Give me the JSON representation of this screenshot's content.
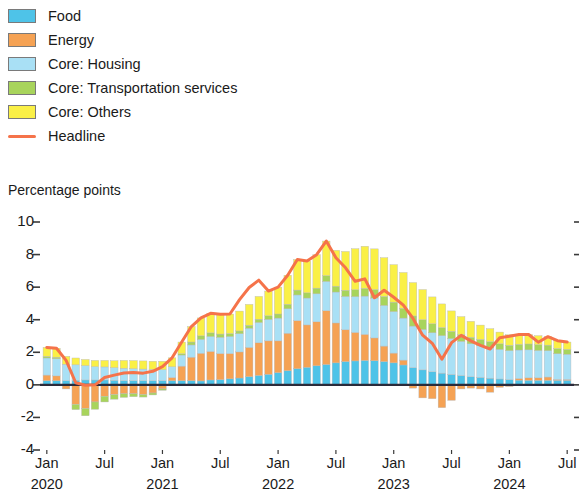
{
  "legend": {
    "items": [
      {
        "label": "Food",
        "color": "#4EC3E8",
        "marker": "swatch"
      },
      {
        "label": "Energy",
        "color": "#F5A254",
        "marker": "swatch"
      },
      {
        "label": "Core: Housing",
        "color": "#A9E0F5",
        "marker": "swatch"
      },
      {
        "label": "Core: Transportation services",
        "color": "#A8D45C",
        "marker": "swatch"
      },
      {
        "label": "Core: Others",
        "color": "#FAF046",
        "marker": "swatch"
      },
      {
        "label": "Headline",
        "color": "#F5734A",
        "marker": "line"
      }
    ]
  },
  "axis_title": "Percentage points",
  "chart_data": {
    "type": "bar",
    "stacked": true,
    "title": "",
    "subtitle": "",
    "xlabel": "",
    "ylabel": "Percentage points",
    "ylim": [
      -4,
      10
    ],
    "yticks": [
      10,
      8,
      6,
      4,
      2,
      0,
      -2,
      -4
    ],
    "ytick_labels": [
      "10",
      "8",
      "6",
      "4",
      "2",
      "0",
      "-2",
      "-4"
    ],
    "grid": false,
    "legend_position": "top-left",
    "x_tick_labels": [
      {
        "label": "Jan",
        "year": "2020",
        "index": 0
      },
      {
        "label": "Jul",
        "year": "",
        "index": 6
      },
      {
        "label": "Jan",
        "year": "2021",
        "index": 12
      },
      {
        "label": "Jul",
        "year": "",
        "index": 18
      },
      {
        "label": "Jan",
        "year": "2022",
        "index": 24
      },
      {
        "label": "Jul",
        "year": "",
        "index": 30
      },
      {
        "label": "Jan",
        "year": "2023",
        "index": 36
      },
      {
        "label": "Jul",
        "year": "",
        "index": 42
      },
      {
        "label": "Jan",
        "year": "2024",
        "index": 48
      },
      {
        "label": "Jul",
        "year": "",
        "index": 54
      }
    ],
    "categories": [
      "Jan 2020",
      "Feb 2020",
      "Mar 2020",
      "Apr 2020",
      "May 2020",
      "Jun 2020",
      "Jul 2020",
      "Aug 2020",
      "Sep 2020",
      "Oct 2020",
      "Nov 2020",
      "Dec 2020",
      "Jan 2021",
      "Feb 2021",
      "Mar 2021",
      "Apr 2021",
      "May 2021",
      "Jun 2021",
      "Jul 2021",
      "Aug 2021",
      "Sep 2021",
      "Oct 2021",
      "Nov 2021",
      "Dec 2021",
      "Jan 2022",
      "Feb 2022",
      "Mar 2022",
      "Apr 2022",
      "May 2022",
      "Jun 2022",
      "Jul 2022",
      "Aug 2022",
      "Sep 2022",
      "Oct 2022",
      "Nov 2022",
      "Dec 2022",
      "Jan 2023",
      "Feb 2023",
      "Mar 2023",
      "Apr 2023",
      "May 2023",
      "Jun 2023",
      "Jul 2023",
      "Aug 2023",
      "Sep 2023",
      "Oct 2023",
      "Nov 2023",
      "Dec 2023",
      "Jan 2024",
      "Feb 2024",
      "Mar 2024",
      "Apr 2024",
      "May 2024",
      "Jun 2024",
      "Jul 2024"
    ],
    "series": [
      {
        "name": "Food",
        "color": "#4EC3E8",
        "values": [
          0.25,
          0.25,
          0.25,
          0.28,
          0.3,
          0.3,
          0.3,
          0.28,
          0.26,
          0.25,
          0.25,
          0.25,
          0.25,
          0.25,
          0.25,
          0.25,
          0.24,
          0.3,
          0.32,
          0.37,
          0.42,
          0.5,
          0.58,
          0.65,
          0.75,
          0.87,
          0.99,
          1.08,
          1.17,
          1.25,
          1.35,
          1.43,
          1.47,
          1.5,
          1.48,
          1.43,
          1.35,
          1.22,
          1.06,
          0.92,
          0.8,
          0.72,
          0.64,
          0.57,
          0.5,
          0.46,
          0.41,
          0.36,
          0.32,
          0.29,
          0.28,
          0.28,
          0.28,
          0.28,
          0.28
        ]
      },
      {
        "name": "Energy",
        "color": "#F5A254",
        "values": [
          0.35,
          0.3,
          -0.25,
          -1.2,
          -1.45,
          -1.05,
          -0.7,
          -0.6,
          -0.55,
          -0.55,
          -0.6,
          -0.5,
          -0.25,
          0.2,
          0.9,
          1.45,
          1.7,
          1.75,
          1.6,
          1.55,
          1.6,
          1.8,
          2.0,
          2.05,
          1.95,
          2.3,
          2.95,
          2.6,
          2.7,
          3.3,
          2.45,
          1.95,
          1.75,
          1.6,
          1.4,
          0.95,
          0.6,
          0.3,
          -0.2,
          -0.8,
          -0.85,
          -1.4,
          -0.95,
          -0.25,
          -0.2,
          -0.25,
          -0.45,
          -0.15,
          -0.1,
          0.1,
          0.15,
          0.15,
          0.2,
          0.05,
          0.05
        ]
      },
      {
        "name": "Core: Housing",
        "color": "#A9E0F5",
        "values": [
          1.05,
          1.05,
          1.02,
          0.95,
          0.88,
          0.82,
          0.8,
          0.78,
          0.76,
          0.74,
          0.72,
          0.7,
          0.68,
          0.66,
          0.68,
          0.75,
          0.85,
          0.92,
          1.0,
          1.05,
          1.12,
          1.18,
          1.25,
          1.32,
          1.4,
          1.5,
          1.58,
          1.65,
          1.72,
          1.8,
          1.9,
          2.05,
          2.2,
          2.35,
          2.45,
          2.5,
          2.55,
          2.58,
          2.55,
          2.48,
          2.4,
          2.3,
          2.2,
          2.1,
          2.02,
          1.95,
          1.88,
          1.82,
          1.78,
          1.75,
          1.72,
          1.68,
          1.62,
          1.58,
          1.55
        ]
      },
      {
        "name": "Core: Transportation services",
        "color": "#A8D45C",
        "values": [
          0.1,
          0.1,
          0.0,
          -0.32,
          -0.45,
          -0.45,
          -0.35,
          -0.28,
          -0.22,
          -0.18,
          -0.15,
          -0.12,
          -0.08,
          0.0,
          0.08,
          0.18,
          0.22,
          0.22,
          0.2,
          0.18,
          0.17,
          0.18,
          0.2,
          0.22,
          0.25,
          0.28,
          0.3,
          0.32,
          0.35,
          0.36,
          0.36,
          0.38,
          0.42,
          0.48,
          0.52,
          0.55,
          0.58,
          0.6,
          0.62,
          0.6,
          0.55,
          0.5,
          0.45,
          0.42,
          0.4,
          0.38,
          0.36,
          0.34,
          0.33,
          0.35,
          0.36,
          0.36,
          0.34,
          0.32,
          0.3
        ]
      },
      {
        "name": "Core: Others",
        "color": "#FAF046",
        "values": [
          0.55,
          0.55,
          0.48,
          0.42,
          0.38,
          0.38,
          0.4,
          0.42,
          0.48,
          0.5,
          0.5,
          0.5,
          0.52,
          0.55,
          0.72,
          0.95,
          1.1,
          1.2,
          1.22,
          1.2,
          1.22,
          1.28,
          1.4,
          1.52,
          1.65,
          1.78,
          1.88,
          1.95,
          2.05,
          2.12,
          2.2,
          2.38,
          2.52,
          2.58,
          2.5,
          2.38,
          2.3,
          2.2,
          2.05,
          1.85,
          1.65,
          1.45,
          1.25,
          1.1,
          0.98,
          0.88,
          0.8,
          0.72,
          0.65,
          0.6,
          0.58,
          0.55,
          0.52,
          0.48,
          0.45
        ]
      }
    ],
    "headline": {
      "name": "Headline",
      "color": "#F5734A",
      "values": [
        2.3,
        2.25,
        1.5,
        0.13,
        -0.02,
        0.0,
        0.45,
        0.6,
        0.73,
        0.76,
        0.72,
        0.83,
        1.12,
        1.66,
        2.63,
        3.58,
        4.11,
        4.39,
        4.34,
        4.35,
        5.23,
        5.98,
        6.43,
        5.76,
        6.0,
        6.73,
        7.7,
        7.6,
        7.99,
        8.83,
        7.81,
        7.19,
        6.36,
        6.51,
        5.35,
        5.81,
        5.38,
        4.9,
        4.08,
        3.05,
        2.55,
        1.57,
        2.59,
        3.04,
        2.7,
        2.42,
        2.2,
        2.89,
        2.98,
        3.09,
        3.09,
        2.62,
        2.96,
        2.71,
        2.63
      ]
    }
  }
}
